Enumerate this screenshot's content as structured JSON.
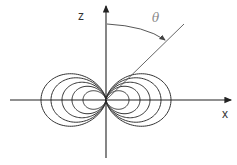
{
  "diagram": {
    "type": "dipole-field-lines",
    "labels": {
      "z_axis": "z",
      "x_axis": "x",
      "angle": "θ"
    },
    "origin": [
      106,
      100
    ],
    "field_line_max_radii": [
      65,
      55,
      44,
      34,
      23
    ],
    "colors": {
      "lines": "#333333",
      "axes": "#222222",
      "radial_line": "#555555",
      "angle_label": "#888888"
    }
  }
}
